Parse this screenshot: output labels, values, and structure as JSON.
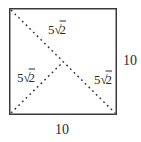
{
  "figure": {
    "shape": "square-with-dashed-diagonals",
    "side_labels": {
      "right": "10",
      "bottom": "10"
    },
    "segment_labels": {
      "diagonal_top": {
        "text": "5√2",
        "coeff": "5",
        "radical": "√",
        "radicand": "2"
      },
      "half_diagonal_left": {
        "text": "5√2",
        "coeff": "5",
        "radical": "√",
        "radicand": "2"
      },
      "diagonal_bottom_right": {
        "text": "5√2",
        "coeff": "5",
        "radical": "√",
        "radicand": "2"
      }
    },
    "colors": {
      "line": "#3a3a3a",
      "text": "#2b2b2b",
      "background": "#ffffff"
    }
  }
}
